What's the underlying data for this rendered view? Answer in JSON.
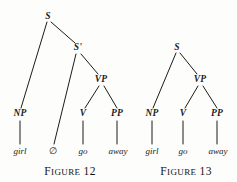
{
  "diagram": {
    "kind": "syntax-tree-pair",
    "background_color": "#fdfdfc",
    "ink_color": "#1b1b1b",
    "figures": [
      {
        "id": "figure-12",
        "caption_word": "Figure",
        "caption_number": "12",
        "caption_full": "FIGURE 12",
        "nodes": [
          {
            "id": "s",
            "label": "S",
            "x": 48,
            "y": 17
          },
          {
            "id": "sbar",
            "label": "S'",
            "x": 78,
            "y": 48
          },
          {
            "id": "vp",
            "label": "VP",
            "x": 101,
            "y": 80
          },
          {
            "id": "np",
            "label": "NP",
            "x": 20,
            "y": 114
          },
          {
            "id": "v",
            "label": "V",
            "x": 83,
            "y": 114
          },
          {
            "id": "pp",
            "label": "PP",
            "x": 117,
            "y": 114
          }
        ],
        "leaves": [
          {
            "id": "girl",
            "label": "girl",
            "x": 20,
            "y": 151,
            "style": "italic"
          },
          {
            "id": "null",
            "label": "∅",
            "x": 53,
            "y": 151,
            "style": "symbol"
          },
          {
            "id": "go",
            "label": "go",
            "x": 83,
            "y": 151,
            "style": "italic"
          },
          {
            "id": "away",
            "label": "away",
            "x": 118,
            "y": 151,
            "style": "italic"
          }
        ],
        "edges": [
          {
            "from": "s",
            "to": "np",
            "kind": "diagonal"
          },
          {
            "from": "s",
            "to": "sbar",
            "kind": "diagonal"
          },
          {
            "from": "sbar",
            "to": "null",
            "kind": "diagonal"
          },
          {
            "from": "sbar",
            "to": "vp",
            "kind": "diagonal"
          },
          {
            "from": "vp",
            "to": "v",
            "kind": "diagonal"
          },
          {
            "from": "vp",
            "to": "pp",
            "kind": "diagonal"
          },
          {
            "from": "np",
            "to": "girl",
            "kind": "vertical"
          },
          {
            "from": "v",
            "to": "go",
            "kind": "vertical"
          },
          {
            "from": "pp",
            "to": "away",
            "kind": "vertical"
          }
        ],
        "caption_x": 70,
        "caption_y": 172
      },
      {
        "id": "figure-13",
        "caption_word": "Figure",
        "caption_number": "13",
        "caption_full": "FIGURE 13",
        "nodes": [
          {
            "id": "s",
            "label": "S",
            "x": 177,
            "y": 48
          },
          {
            "id": "vp",
            "label": "VP",
            "x": 200,
            "y": 80
          },
          {
            "id": "np",
            "label": "NP",
            "x": 152,
            "y": 114
          },
          {
            "id": "v",
            "label": "V",
            "x": 183,
            "y": 114
          },
          {
            "id": "pp",
            "label": "PP",
            "x": 217,
            "y": 114
          }
        ],
        "leaves": [
          {
            "id": "girl",
            "label": "girl",
            "x": 152,
            "y": 151,
            "style": "italic"
          },
          {
            "id": "go",
            "label": "go",
            "x": 183,
            "y": 151,
            "style": "italic"
          },
          {
            "id": "away",
            "label": "away",
            "x": 218,
            "y": 151,
            "style": "italic"
          }
        ],
        "edges": [
          {
            "from": "s",
            "to": "np",
            "kind": "diagonal"
          },
          {
            "from": "s",
            "to": "vp",
            "kind": "diagonal"
          },
          {
            "from": "vp",
            "to": "v",
            "kind": "diagonal"
          },
          {
            "from": "vp",
            "to": "pp",
            "kind": "diagonal"
          },
          {
            "from": "np",
            "to": "girl",
            "kind": "vertical"
          },
          {
            "from": "v",
            "to": "go",
            "kind": "vertical"
          },
          {
            "from": "pp",
            "to": "away",
            "kind": "vertical"
          }
        ],
        "caption_x": 186,
        "caption_y": 172
      }
    ]
  }
}
